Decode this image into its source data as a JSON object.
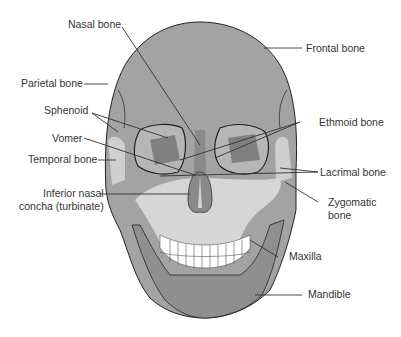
{
  "diagram": {
    "type": "anatomical-illustration",
    "colors": {
      "skull_dark": "#8e8e8e",
      "skull_mid": "#a6a6a6",
      "skull_light": "#d4d4d4",
      "orbit_inner": "#7a7a7a",
      "teeth": "#ffffff",
      "outline": "#222222",
      "leader": "#333333",
      "label_text": "#333333"
    },
    "labels": {
      "nasal_bone": "Nasal bone",
      "frontal_bone": "Frontal bone",
      "parietal_bone": "Parietal bone",
      "sphenoid": "Sphenoid",
      "ethmoid_bone": "Ethmoid bone",
      "vomer": "Vomer",
      "temporal_bone": "Temporal bone",
      "lacrimal_bone": "Lacrimal bone",
      "inferior_nasal_line1": "Inferior nasal",
      "inferior_nasal_line2": "concha (turbinate)",
      "zygomatic_line1": "Zygomatic",
      "zygomatic_line2": "bone",
      "maxilla": "Maxilla",
      "mandible": "Mandible"
    }
  }
}
